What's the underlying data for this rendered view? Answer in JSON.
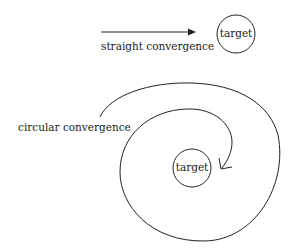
{
  "diagram": {
    "straight": {
      "label": "straight convergence",
      "target_label": "target"
    },
    "circular": {
      "label": "circular convergence",
      "target_label": "target"
    },
    "colors": {
      "stroke": "#222222",
      "background": "#ffffff"
    }
  }
}
